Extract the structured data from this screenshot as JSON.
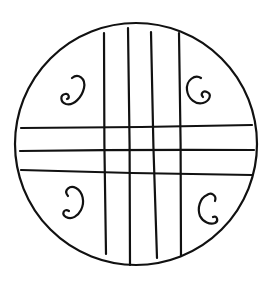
{
  "figure": {
    "stroke_color": "#111111",
    "background_color": "#ffffff",
    "circle": {
      "cx": 136,
      "cy": 144,
      "r": 121
    },
    "vertical_lines": [
      {
        "x1": 104,
        "y1": 33,
        "x2": 106,
        "y2": 254
      },
      {
        "x1": 128,
        "y1": 28,
        "x2": 130,
        "y2": 265
      },
      {
        "x1": 151,
        "y1": 32,
        "x2": 157,
        "y2": 258
      },
      {
        "x1": 179,
        "y1": 33,
        "x2": 181,
        "y2": 256
      }
    ],
    "horizontal_lines": [
      {
        "x1": 21,
        "y1": 128,
        "x2": 252,
        "y2": 125
      },
      {
        "x1": 20,
        "y1": 151,
        "x2": 254,
        "y2": 150
      },
      {
        "x1": 21,
        "y1": 170,
        "x2": 252,
        "y2": 175
      }
    ],
    "spirals": [
      {
        "position": "top-left"
      },
      {
        "position": "top-right"
      },
      {
        "position": "bottom-left"
      },
      {
        "position": "bottom-right"
      }
    ]
  }
}
